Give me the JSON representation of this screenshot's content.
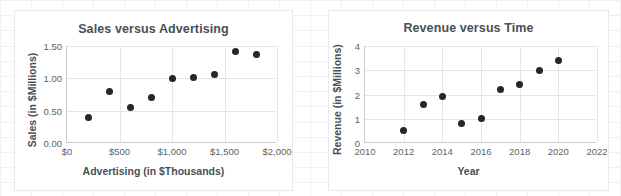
{
  "page": {
    "background": "#ffffff",
    "grid_color": "#f0f1f2",
    "frame_border_color": "#e8e9ea"
  },
  "charts": [
    {
      "id": "sales-versus-advertising",
      "title": "Sales versus Advertising",
      "xlabel": "Advertising (in $Thousands)",
      "ylabel": "Sales (in $Millions)"
    },
    {
      "id": "revenue-versus-time",
      "title": "Revenue versus Time",
      "xlabel": "Year",
      "ylabel": "Revenue (in $Millions)"
    }
  ],
  "chart_data": [
    {
      "type": "scatter",
      "title": "Sales versus Advertising",
      "xlabel": "Advertising (in $Thousands)",
      "ylabel": "Sales (in $Millions)",
      "xlim": [
        0,
        2000
      ],
      "ylim": [
        0.0,
        1.5
      ],
      "xticks": [
        0,
        500,
        1000,
        1500,
        2000
      ],
      "xticklabels": [
        "$0",
        "$500",
        "$1,000",
        "$1,500",
        "$2,000"
      ],
      "yticks": [
        0.0,
        0.5,
        1.0,
        1.5
      ],
      "yticklabels": [
        "0.00",
        "0.50",
        "1.00",
        "1.50"
      ],
      "grid": "horizontal-and-vertical",
      "legend": "none",
      "marker_color": "#262626",
      "x": [
        200,
        400,
        600,
        800,
        1000,
        1200,
        1400,
        1600,
        1800
      ],
      "y": [
        0.4,
        0.8,
        0.55,
        0.7,
        1.0,
        1.02,
        1.06,
        1.41,
        1.37
      ],
      "points": [
        {
          "x": 200,
          "y": 0.4
        },
        {
          "x": 400,
          "y": 0.8
        },
        {
          "x": 600,
          "y": 0.55
        },
        {
          "x": 800,
          "y": 0.7
        },
        {
          "x": 1000,
          "y": 1.0
        },
        {
          "x": 1200,
          "y": 1.02
        },
        {
          "x": 1400,
          "y": 1.06
        },
        {
          "x": 1600,
          "y": 1.41
        },
        {
          "x": 1800,
          "y": 1.37
        }
      ]
    },
    {
      "type": "scatter",
      "title": "Revenue versus Time",
      "xlabel": "Year",
      "ylabel": "Revenue (in $Millions)",
      "xlim": [
        2010,
        2022
      ],
      "ylim": [
        0,
        4
      ],
      "xticks": [
        2010,
        2012,
        2014,
        2016,
        2018,
        2020,
        2022
      ],
      "xticklabels": [
        "2010",
        "2012",
        "2014",
        "2016",
        "2018",
        "2020",
        "2022"
      ],
      "yticks": [
        0,
        1,
        2,
        3,
        4
      ],
      "yticklabels": [
        "0",
        "1",
        "2",
        "3",
        "4"
      ],
      "grid": "horizontal-and-vertical",
      "legend": "none",
      "marker_color": "#262626",
      "x": [
        2012,
        2013,
        2014,
        2015,
        2016,
        2017,
        2018,
        2019,
        2020
      ],
      "y": [
        0.5,
        1.6,
        1.9,
        0.8,
        1.0,
        2.2,
        2.4,
        3.0,
        3.4
      ],
      "points": [
        {
          "x": 2012,
          "y": 0.5
        },
        {
          "x": 2013,
          "y": 1.6
        },
        {
          "x": 2014,
          "y": 1.9
        },
        {
          "x": 2015,
          "y": 0.8
        },
        {
          "x": 2016,
          "y": 1.0
        },
        {
          "x": 2017,
          "y": 2.2
        },
        {
          "x": 2018,
          "y": 2.4
        },
        {
          "x": 2019,
          "y": 3.0
        },
        {
          "x": 2020,
          "y": 3.4
        }
      ]
    }
  ]
}
